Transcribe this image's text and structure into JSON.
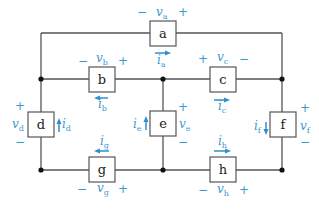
{
  "diagram": {
    "type": "circuit",
    "elements": [
      {
        "id": "a",
        "label": "a",
        "voltage": "v",
        "voltage_sub": "a",
        "current": "i",
        "current_sub": "a",
        "voltage_polarity": [
          "−",
          "+"
        ],
        "current_direction": "right"
      },
      {
        "id": "b",
        "label": "b",
        "voltage": "v",
        "voltage_sub": "b",
        "current": "i",
        "current_sub": "b",
        "voltage_polarity": [
          "−",
          "+"
        ],
        "current_direction": "left"
      },
      {
        "id": "c",
        "label": "c",
        "voltage": "v",
        "voltage_sub": "c",
        "current": "i",
        "current_sub": "c",
        "voltage_polarity": [
          "+",
          "−"
        ],
        "current_direction": "right"
      },
      {
        "id": "d",
        "label": "d",
        "voltage": "v",
        "voltage_sub": "d",
        "current": "i",
        "current_sub": "d",
        "voltage_polarity": [
          "+",
          "−"
        ],
        "current_direction": "up"
      },
      {
        "id": "e",
        "label": "e",
        "voltage": "v",
        "voltage_sub": "e",
        "current": "i",
        "current_sub": "e",
        "voltage_polarity": [
          "+",
          "−"
        ],
        "current_direction": "up"
      },
      {
        "id": "f",
        "label": "f",
        "voltage": "v",
        "voltage_sub": "f",
        "current": "i",
        "current_sub": "f",
        "voltage_polarity": [
          "+",
          "−"
        ],
        "current_direction": "down"
      },
      {
        "id": "g",
        "label": "g",
        "voltage": "v",
        "voltage_sub": "g",
        "current": "i",
        "current_sub": "g",
        "voltage_polarity": [
          "−",
          "+"
        ],
        "current_direction": "left"
      },
      {
        "id": "h",
        "label": "h",
        "voltage": "v",
        "voltage_sub": "h",
        "current": "i",
        "current_sub": "h",
        "voltage_polarity": [
          "−",
          "+"
        ],
        "current_direction": "right"
      }
    ],
    "colors": {
      "wire": "#555555",
      "annotation": "#3a9ad0",
      "node": "#111111"
    }
  }
}
